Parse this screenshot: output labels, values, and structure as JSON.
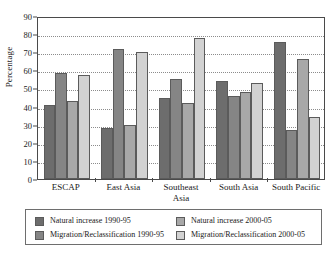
{
  "chart_data": {
    "type": "bar",
    "title": "",
    "subtitle": "",
    "xlabel": "",
    "ylabel": "Percentage",
    "ylim": [
      0,
      90
    ],
    "ytick_step": 10,
    "yticks": [
      0,
      10,
      20,
      30,
      40,
      50,
      60,
      70,
      80,
      90
    ],
    "grid": true,
    "grid_axis": "y",
    "grid_style": "dotted",
    "legend_position": "bottom",
    "categories": [
      "ESCAP",
      "East Asia",
      "Southeast Asia",
      "South Asia",
      "South Pacific"
    ],
    "category_lines": [
      [
        "ESCAP"
      ],
      [
        "East Asia"
      ],
      [
        "Southeast",
        "Asia"
      ],
      [
        "South Asia"
      ],
      [
        "South Pacific"
      ]
    ],
    "series": [
      {
        "name": "Natural increase 1990-95",
        "color": "#6d6d6d",
        "values": [
          41,
          28,
          45,
          54,
          75.5
        ]
      },
      {
        "name": "Migration/Reclassification 1990-95",
        "color": "#858585",
        "values": [
          58.5,
          72,
          55,
          46,
          27
        ]
      },
      {
        "name": "Natural increase 2000-05",
        "color": "#a8a8a8",
        "values": [
          43,
          30,
          42,
          48,
          66.5
        ]
      },
      {
        "name": "Migration/Reclassification 2000-05",
        "color": "#d2d2d2",
        "values": [
          57.5,
          70,
          78,
          53,
          34.5
        ]
      }
    ]
  },
  "legend": {
    "items": [
      {
        "label": "Natural increase 1990-95",
        "color": "#6d6d6d"
      },
      {
        "label": "Natural increase 2000-05",
        "color": "#a8a8a8"
      },
      {
        "label": "Migration/Reclassification 1990-95",
        "color": "#858585"
      },
      {
        "label": "Migration/Reclassification 2000-05",
        "color": "#d2d2d2"
      }
    ]
  },
  "colors": {
    "axis": "#4a4a4a",
    "grid": "#8c8c8c",
    "text": "#1a1a1a",
    "background": "#ffffff",
    "bar_outline": "#5b5b5b"
  }
}
